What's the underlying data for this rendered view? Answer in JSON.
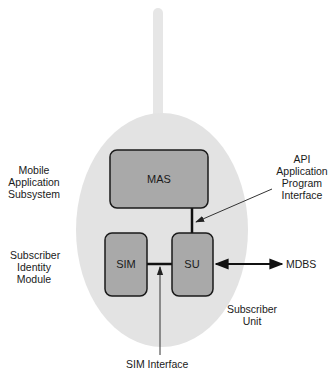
{
  "diagram": {
    "colors": {
      "ellipse_fill": "#e3e3e3",
      "antenna_fill": "#e6e6e6",
      "box_fill": "#a9a9a9",
      "box_stroke": "#1a1a1a",
      "line": "#111111",
      "text": "#1a1a1a"
    },
    "boxes": {
      "mas": "MAS",
      "sim": "SIM",
      "su": "SU"
    },
    "labels": {
      "mobile_application_subsystem": [
        "Mobile",
        "Application",
        "Subsystem"
      ],
      "subscriber_identity_module": [
        "Subscriber",
        "Identity",
        "Module"
      ],
      "api": [
        "API",
        "Application",
        "Program",
        "Interface"
      ],
      "subscriber_unit": [
        "Subscriber",
        "Unit"
      ],
      "mdbs": "MDBS",
      "sim_interface": "SIM Interface"
    }
  }
}
